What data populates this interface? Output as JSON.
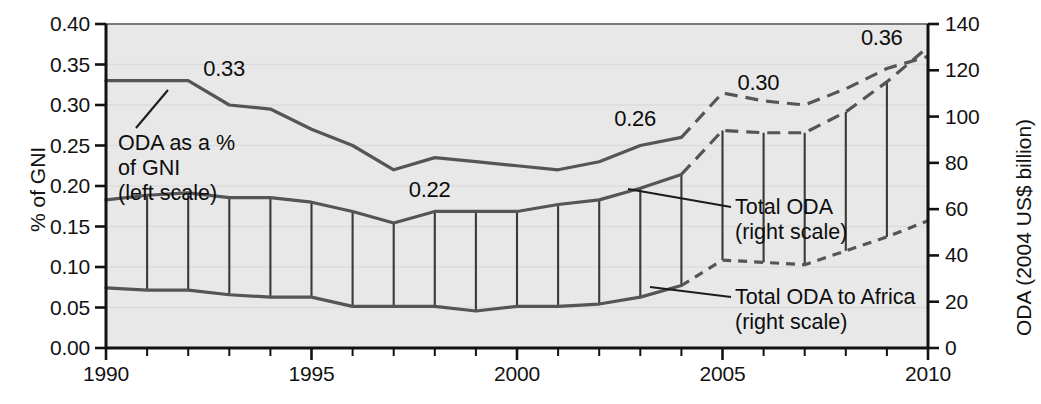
{
  "chart_data": {
    "type": "line",
    "title": "",
    "subtitle": "",
    "xlabel": "",
    "ylabel": "% of GNI",
    "ylabel_right": "ODA (2004 US$ billion)",
    "xlim": [
      1990,
      2010
    ],
    "ylim": [
      0.0,
      0.4
    ],
    "ylim_right": [
      0,
      140
    ],
    "grid": false,
    "legend_position": "inline-annotations",
    "x": [
      1990,
      1991,
      1992,
      1993,
      1994,
      1995,
      1996,
      1997,
      1998,
      1999,
      2000,
      2001,
      2002,
      2003,
      2004,
      2005,
      2006,
      2007,
      2008,
      2009,
      2010
    ],
    "xticks": [
      1990,
      1995,
      2000,
      2005,
      2010
    ],
    "xtick_labels": [
      "1990",
      "1995",
      "2000",
      "2005",
      "2010"
    ],
    "yticks_left": [
      0.0,
      0.05,
      0.1,
      0.15,
      0.2,
      0.25,
      0.3,
      0.35,
      0.4
    ],
    "ytick_labels_left": [
      "0.00",
      "0.05",
      "0.10",
      "0.15",
      "0.20",
      "0.25",
      "0.30",
      "0.35",
      "0.40"
    ],
    "yticks_right": [
      0,
      20,
      40,
      60,
      80,
      100,
      120,
      140
    ],
    "ytick_labels_right": [
      "0",
      "20",
      "40",
      "60",
      "80",
      "100",
      "120",
      "140"
    ],
    "series": [
      {
        "name": "ODA as a % of GNI (left scale)",
        "axis": "left",
        "units": "% of GNI",
        "style_actual": "solid",
        "style_projected": "dashed",
        "projection_starts": 2004,
        "values": [
          0.33,
          0.33,
          0.33,
          0.3,
          0.295,
          0.27,
          0.25,
          0.22,
          0.235,
          0.23,
          0.225,
          0.22,
          0.23,
          0.25,
          0.26,
          0.315,
          0.305,
          0.3,
          0.32,
          0.345,
          0.36
        ]
      },
      {
        "name": "Total ODA (right scale)",
        "axis": "right",
        "units": "2004 US$ billion",
        "style_actual": "solid",
        "style_projected": "dashed",
        "projection_starts": 2004,
        "values": [
          64,
          66,
          67,
          65,
          65,
          63,
          59,
          54,
          59,
          59,
          59,
          62,
          64,
          69,
          75,
          94,
          93,
          93,
          102,
          115,
          130
        ]
      },
      {
        "name": "Total ODA to Africa (right scale)",
        "axis": "right",
        "units": "2004 US$ billion",
        "style_actual": "solid",
        "style_projected": "dashed",
        "projection_starts": 2004,
        "values": [
          26,
          25,
          25,
          23,
          22,
          22,
          18,
          18,
          18,
          16,
          18,
          18,
          19,
          22,
          27,
          38,
          37,
          36,
          42,
          48,
          55
        ]
      }
    ],
    "drop_lines": {
      "description": "vertical connector lines between Total ODA and Total ODA to Africa at each year",
      "years": [
        1990,
        1991,
        1992,
        1993,
        1994,
        1995,
        1996,
        1997,
        1998,
        1999,
        2000,
        2001,
        2002,
        2003,
        2004,
        2005,
        2006,
        2007,
        2008,
        2009,
        2010
      ]
    },
    "data_labels": [
      {
        "text": "0.33",
        "year": 1993,
        "value": 0.345
      },
      {
        "text": "0.22",
        "year": 1998,
        "value": 0.195
      },
      {
        "text": "0.26",
        "year": 2003,
        "value": 0.283
      },
      {
        "text": "0.30",
        "year": 2006,
        "value": 0.327
      },
      {
        "text": "0.36",
        "year": 2009,
        "value": 0.383
      }
    ],
    "annotations": [
      {
        "id": "gni-annotation",
        "lines": [
          "ODA as a %",
          "of GNI",
          "(left scale)"
        ],
        "leader": true
      },
      {
        "id": "total-oda-annotation",
        "lines": [
          "Total ODA",
          "(right scale)"
        ],
        "leader": true
      },
      {
        "id": "africa-oda-annotation",
        "lines": [
          "Total ODA to Africa",
          "(right scale)"
        ],
        "leader": true
      }
    ]
  },
  "colors": {
    "plot_background": "#e8e8e8",
    "axis": "#121212",
    "line": "#555555",
    "text": "#0d0d0d",
    "page_background": "#ffffff"
  }
}
